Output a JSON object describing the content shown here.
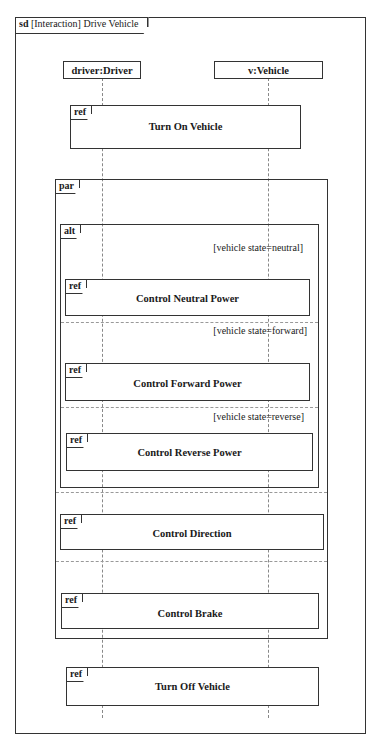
{
  "diagram": {
    "frame_kind": "sd",
    "frame_title": "[Interaction] Drive Vehicle",
    "lifelines": [
      {
        "label": "driver:Driver"
      },
      {
        "label": "v:Vehicle"
      }
    ],
    "refs": {
      "turn_on": {
        "keyword": "ref",
        "title": "Turn On Vehicle"
      },
      "neutral": {
        "keyword": "ref",
        "title": "Control Neutral Power"
      },
      "forward": {
        "keyword": "ref",
        "title": "Control Forward Power"
      },
      "reverse": {
        "keyword": "ref",
        "title": "Control Reverse Power"
      },
      "direction": {
        "keyword": "ref",
        "title": "Control Direction"
      },
      "brake": {
        "keyword": "ref",
        "title": "Control Brake"
      },
      "turn_off": {
        "keyword": "ref",
        "title": "Turn Off Vehicle"
      }
    },
    "par": {
      "keyword": "par"
    },
    "alt": {
      "keyword": "alt",
      "guards": [
        "[vehicle state=neutral]",
        "[vehicle state=forward]",
        "[vehicle state=reverse]"
      ]
    }
  }
}
